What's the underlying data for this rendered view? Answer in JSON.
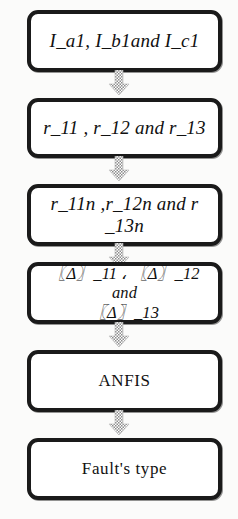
{
  "diagram": {
    "background_color": "#fbfbfa",
    "box_border_color": "#1a1a1a",
    "box_fill_color": "#ffffff",
    "arrow_fill": "halftone-gray",
    "nodes": [
      {
        "id": "currents",
        "text": "I_a1, I_b1and I_c1",
        "style": "math"
      },
      {
        "id": "residuals",
        "text": "r_11 , r_12 and r_13",
        "style": "math"
      },
      {
        "id": "normalized-residuals",
        "text": "r_11n ,r_12n and  r\n_13n",
        "style": "math"
      },
      {
        "id": "deltas",
        "text": "〖Δ〗_11 ، 〖Δ〗_12  and\n〖Δ〗_13",
        "style": "math-sm"
      },
      {
        "id": "anfis",
        "text": "ANFIS",
        "style": "plain"
      },
      {
        "id": "fault-type",
        "text": "Fault's type",
        "style": "plain"
      }
    ],
    "arrows": [
      {
        "id": "arrow-1",
        "from": "currents",
        "to": "residuals",
        "direction": "down"
      },
      {
        "id": "arrow-2",
        "from": "residuals",
        "to": "normalized-residuals",
        "direction": "down"
      },
      {
        "id": "arrow-3",
        "from": "normalized-residuals",
        "to": "deltas",
        "direction": "down"
      },
      {
        "id": "arrow-4",
        "from": "deltas",
        "to": "anfis",
        "direction": "down"
      },
      {
        "id": "arrow-5",
        "from": "anfis",
        "to": "fault-type",
        "direction": "down"
      }
    ]
  }
}
